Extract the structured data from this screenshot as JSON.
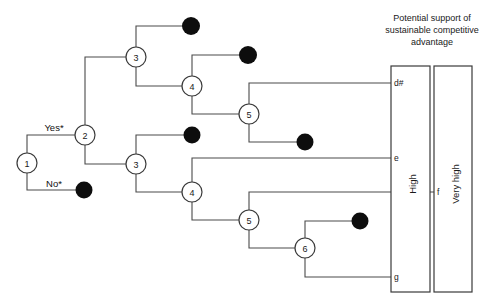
{
  "figure": {
    "title_lines": [
      "Potential support of",
      "sustainable competitive",
      "advantage"
    ],
    "type": "decision-tree-diagram",
    "background_color": "#ffffff",
    "line_color": "#4a4a4a",
    "terminal_color": "#0d0d0d"
  },
  "branch_labels": {
    "yes": "Yes*",
    "no": "No*"
  },
  "decision_nodes": [
    {
      "id": "n1",
      "label": "1",
      "x": 27,
      "y": 163
    },
    {
      "id": "n2",
      "label": "2",
      "x": 85,
      "y": 135
    },
    {
      "id": "n3u",
      "label": "3",
      "x": 136,
      "y": 57
    },
    {
      "id": "n4u",
      "label": "4",
      "x": 192,
      "y": 86
    },
    {
      "id": "n5u",
      "label": "5",
      "x": 249,
      "y": 114
    },
    {
      "id": "n3l",
      "label": "3",
      "x": 136,
      "y": 164
    },
    {
      "id": "n4l",
      "label": "4",
      "x": 192,
      "y": 192
    },
    {
      "id": "n5l",
      "label": "5",
      "x": 249,
      "y": 220
    },
    {
      "id": "n6",
      "label": "6",
      "x": 305,
      "y": 248
    }
  ],
  "terminal_nodes": [
    {
      "id": "t-no",
      "x": 84,
      "y": 190
    },
    {
      "id": "t-a",
      "x": 191,
      "y": 26
    },
    {
      "id": "t-b",
      "x": 248,
      "y": 55
    },
    {
      "id": "t-c",
      "x": 305,
      "y": 142
    },
    {
      "id": "t-d",
      "x": 192,
      "y": 135
    },
    {
      "id": "t-e",
      "x": 360,
      "y": 221
    }
  ],
  "outcome_boxes": [
    {
      "id": "box-high",
      "label": "High",
      "x": 391,
      "y": 66,
      "width": 39,
      "height": 226,
      "ticks": [
        {
          "id": "tick-dsharp",
          "label": "d#",
          "y": 83
        },
        {
          "id": "tick-e",
          "label": "e",
          "y": 158
        },
        {
          "id": "tick-g",
          "label": "g",
          "y": 277
        }
      ]
    },
    {
      "id": "box-very-high",
      "label": "Very high",
      "x": 434,
      "y": 66,
      "width": 38,
      "height": 226,
      "ticks": [
        {
          "id": "tick-f",
          "label": "f",
          "y": 192
        }
      ]
    }
  ],
  "outcome_values": [
    "d#",
    "e",
    "f",
    "g"
  ],
  "support_levels": [
    "High",
    "Very high"
  ]
}
